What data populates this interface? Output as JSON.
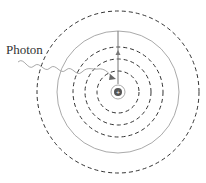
{
  "diagram": {
    "label": "Photon",
    "center": [
      118,
      92
    ],
    "outer_dashed_radius": 81,
    "gray_solid_radius": 61,
    "dashed_radii": [
      45,
      33,
      21
    ],
    "inner_ring_radius": 7,
    "nucleus_radius": 4,
    "colors": {
      "dashed": "#333333",
      "gray": "#aaaaaa",
      "nucleus": "#555555"
    }
  }
}
